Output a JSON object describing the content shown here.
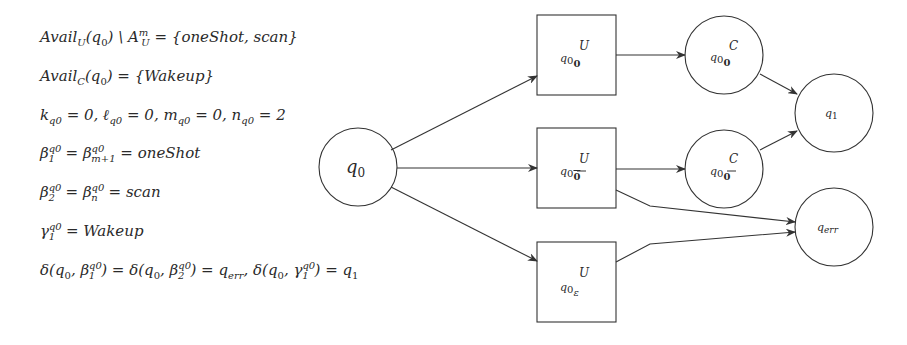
{
  "equations": [
    {
      "id": "avail-u",
      "text": "Avail_U(q0) \\ A_U^m = {oneShot, scan}",
      "lhs": "Avail",
      "lhs_sub": "U",
      "arg": "(q",
      "arg_sub": "0",
      "arg_close": ") \\ A",
      "a_sub": "U",
      "a_sup": "m",
      "rhs": " = {oneShot, scan}"
    },
    {
      "id": "avail-c",
      "text": "Avail_C(q0) = {Wakeup}",
      "lhs": "Avail",
      "lhs_sub": "C",
      "arg": "(q",
      "arg_sub": "0",
      "rhs": ") = {Wakeup}"
    },
    {
      "id": "counts",
      "text": "k_q0 = 0, ℓ_q0 = 0, m_q0 = 0, n_q0 = 2",
      "parts": [
        "k",
        "q0",
        " = 0, ",
        "ℓ",
        "q0",
        " = 0, m",
        "q0",
        " = 0, n",
        "q0",
        " = 2"
      ]
    },
    {
      "id": "beta1",
      "text": "β_1^q0 = β_{m+1}^q0 = oneShot",
      "b1_sub": "1",
      "sup": "q0",
      "mid": " = β",
      "b2_sub": "m+1",
      "rhs": " = oneShot"
    },
    {
      "id": "beta2",
      "text": "β_2^q0 = β_n^q0 = scan",
      "b1_sub": "2",
      "sup": "q0",
      "mid": " = β",
      "b2_sub": "n",
      "rhs": " = scan"
    },
    {
      "id": "gamma1",
      "text": "γ_1^q0 = Wakeup",
      "sub": "1",
      "sup": "q0",
      "rhs": " = Wakeup"
    },
    {
      "id": "delta",
      "text": "δ(q0, β_1^q0) = δ(q0, β_2^q0) = q_err, δ(q0, γ_1^q0) = q1"
    }
  ],
  "delta_parts": {
    "p1": "δ(q",
    "s0": "0",
    "p2": ", β",
    "b1": "1",
    "q0": "q0",
    "p3": ") = δ(q",
    "p4": ", β",
    "b2": "2",
    "p5": ") = q",
    "err": "err",
    "p6": ", δ(q",
    "p7": ", γ",
    "g1": "1",
    "p8": ") = q",
    "one": "1"
  },
  "graph": {
    "nodes": [
      {
        "id": "q0",
        "shape": "circle",
        "label": "q",
        "sub": "0",
        "sup": "",
        "cx": 358,
        "cy": 167,
        "r": 39
      },
      {
        "id": "q0U_0",
        "shape": "box",
        "label": "q",
        "sub": "0",
        "subsub": "0",
        "sup": "U",
        "x": 537,
        "y": 15,
        "w": 79,
        "h": 80
      },
      {
        "id": "q0U_0bar",
        "shape": "box",
        "label": "q",
        "sub": "0",
        "subsub": "0̄",
        "sup": "U",
        "x": 537,
        "y": 128,
        "w": 79,
        "h": 80
      },
      {
        "id": "q0U_eps",
        "shape": "box",
        "label": "q",
        "sub": "0",
        "subsub": "ε",
        "sup": "U",
        "x": 537,
        "y": 242,
        "w": 79,
        "h": 80
      },
      {
        "id": "q0C_0",
        "shape": "circle",
        "label": "q",
        "sub": "0",
        "subsub": "0",
        "sup": "C",
        "cx": 724,
        "cy": 55,
        "r": 39
      },
      {
        "id": "q0C_0bar",
        "shape": "circle",
        "label": "q",
        "sub": "0",
        "subsub": "0̄",
        "sup": "C",
        "cx": 724,
        "cy": 169,
        "r": 39
      },
      {
        "id": "q1",
        "shape": "circle",
        "label": "q",
        "sub": "1",
        "cx": 834,
        "cy": 113,
        "r": 39
      },
      {
        "id": "qerr",
        "shape": "circle",
        "label": "q",
        "sub": "err",
        "cx": 834,
        "cy": 227,
        "r": 39
      }
    ],
    "edges": [
      {
        "from": "q0",
        "to": "q0U_0"
      },
      {
        "from": "q0",
        "to": "q0U_0bar"
      },
      {
        "from": "q0",
        "to": "q0U_eps"
      },
      {
        "from": "q0U_0",
        "to": "q0C_0"
      },
      {
        "from": "q0U_0bar",
        "to": "q0C_0bar"
      },
      {
        "from": "q0C_0",
        "to": "q1"
      },
      {
        "from": "q0C_0bar",
        "to": "q1"
      },
      {
        "from": "q0U_0bar",
        "to": "qerr"
      },
      {
        "from": "q0U_eps",
        "to": "qerr"
      }
    ],
    "stroke_color": "#333333"
  },
  "labels": {
    "q0": "q",
    "q0_sub": "0",
    "U": "U",
    "C": "C",
    "zero": "0",
    "zerobar": "0",
    "eps": "ε",
    "q1_sub": "1",
    "err_sub": "err"
  }
}
